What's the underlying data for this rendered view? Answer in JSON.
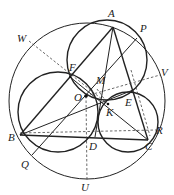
{
  "figure": {
    "type": "geometry-diagram",
    "points": {
      "A": {
        "label": "A",
        "x": 113,
        "y": 27,
        "lx": 108,
        "ly": 17
      },
      "P": {
        "label": "P",
        "x": 137,
        "y": 38,
        "lx": 140,
        "ly": 32
      },
      "V": {
        "label": "V",
        "x": 160,
        "y": 75,
        "lx": 161,
        "ly": 76
      },
      "W": {
        "label": "W",
        "x": 29,
        "y": 41,
        "lx": 17,
        "ly": 42
      },
      "F": {
        "label": "F",
        "x": 70,
        "y": 77,
        "lx": 69,
        "ly": 71
      },
      "M": {
        "label": "M",
        "x": 97,
        "y": 89,
        "lx": 96,
        "ly": 84
      },
      "O": {
        "label": "O",
        "x": 86,
        "y": 96,
        "lx": 74,
        "ly": 101
      },
      "E": {
        "label": "E",
        "x": 133,
        "y": 90,
        "lx": 125,
        "ly": 106
      },
      "K": {
        "label": "K",
        "x": 108,
        "y": 104,
        "lx": 106,
        "ly": 116
      },
      "B": {
        "label": "B",
        "x": 20,
        "y": 135,
        "lx": 8,
        "ly": 141
      },
      "R": {
        "label": "R",
        "x": 156,
        "y": 130,
        "lx": 156,
        "ly": 134
      },
      "C": {
        "label": "C",
        "x": 148,
        "y": 140,
        "lx": 145,
        "ly": 150
      },
      "D": {
        "label": "D",
        "x": 95,
        "y": 137,
        "lx": 89,
        "ly": 150
      },
      "Q": {
        "label": "Q",
        "x": 32,
        "y": 155,
        "lx": 21,
        "ly": 168
      },
      "U": {
        "label": "U",
        "x": 87,
        "y": 180,
        "lx": 81,
        "ly": 191
      }
    },
    "circumcircle": {
      "cx": 87,
      "cy": 101,
      "r": 78
    },
    "circles": [
      {
        "name": "circle-AFK",
        "cx": 107,
        "cy": 60,
        "r": 40
      },
      {
        "name": "circle-BFD",
        "cx": 58,
        "cy": 112,
        "r": 40
      },
      {
        "name": "circle-CED",
        "cx": 128,
        "cy": 122,
        "r": 30
      }
    ],
    "colors": {
      "ink": "#222222",
      "background": "#ffffff"
    }
  }
}
